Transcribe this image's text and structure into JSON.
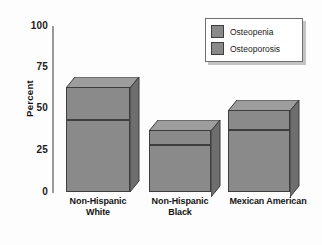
{
  "chart_data": {
    "type": "bar",
    "subtype": "stacked-3d-column",
    "title": "",
    "xlabel": "",
    "ylabel": "Percent",
    "ylim": [
      0,
      100
    ],
    "yticks": [
      0,
      25,
      50,
      75,
      100
    ],
    "ytick_labels": [
      "0",
      "25",
      "50",
      "75",
      "100"
    ],
    "grid": false,
    "legend_position": "top-right",
    "categories": [
      "Non-Hispanic White",
      "Non-Hispanic Black",
      "Mexican American"
    ],
    "category_lines": [
      [
        "Non-Hispanic",
        "White"
      ],
      [
        "Non-Hispanic",
        "Black"
      ],
      [
        "Mexican American",
        ""
      ]
    ],
    "series": [
      {
        "name": "Osteoporosis",
        "values": [
          43,
          28,
          37
        ]
      },
      {
        "name": "Osteopenia",
        "values": [
          20,
          9,
          12
        ]
      }
    ],
    "totals": [
      63,
      37,
      49
    ],
    "colors": {
      "osteopenia": "#8a8a8a",
      "osteoporosis": "#8a8a8a",
      "bar_outline": "#3d3d3d",
      "axis": "#9a9a9a",
      "text": "#141414",
      "background": "#fdfdfd"
    }
  },
  "legend": {
    "items": [
      {
        "label": "Osteopenia"
      },
      {
        "label": "Osteoporosis"
      }
    ]
  },
  "axis": {
    "y_title": "Percent",
    "y_tick_100": "100",
    "y_tick_75": "75",
    "y_tick_50": "50",
    "y_tick_25": "25",
    "y_tick_0": "0"
  },
  "x_labels": {
    "bar1_line1": "Non-Hispanic",
    "bar1_line2": "White",
    "bar2_line1": "Non-Hispanic",
    "bar2_line2": "Black",
    "bar3_line1": "Mexican American",
    "bar3_line2": ""
  }
}
